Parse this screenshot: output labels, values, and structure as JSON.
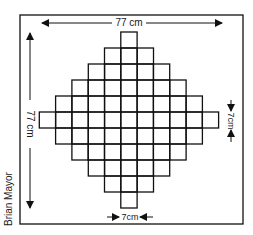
{
  "diagram": {
    "type": "quilt-pattern",
    "shape": "diamond-of-squares",
    "outer_size_label": "77 cm",
    "outer_height_label": "77 cm",
    "square_size_label_bottom": "7cm",
    "square_size_label_right": "7cm",
    "credit": "Brian Mayor",
    "row_counts": [
      1,
      3,
      5,
      7,
      9,
      11,
      9,
      7,
      5,
      3,
      1
    ],
    "colors": {
      "line": "#111111",
      "background": "#ffffff"
    }
  }
}
